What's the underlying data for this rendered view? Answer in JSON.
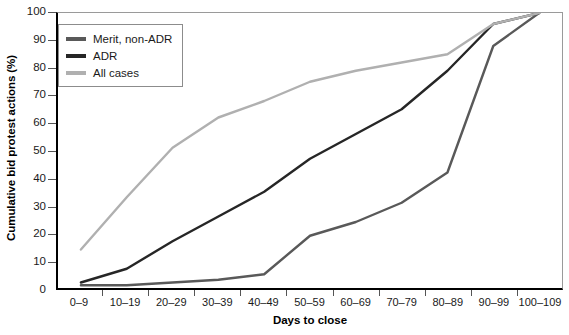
{
  "chart_data": {
    "type": "line",
    "title": "",
    "xlabel": "Days to close",
    "ylabel": "Cumulative bid protest actions (%)",
    "categories": [
      "0–9",
      "10–19",
      "20–29",
      "30–39",
      "40–49",
      "50–59",
      "60–69",
      "70–79",
      "80–89",
      "90–99",
      "100–109"
    ],
    "ylim": [
      0,
      100
    ],
    "yticks": [
      0,
      10,
      20,
      30,
      40,
      50,
      60,
      70,
      80,
      90,
      100
    ],
    "grid": false,
    "legend_position": "top-left",
    "series": [
      {
        "name": "Merit, non-ADR",
        "color": "#595959",
        "values": [
          1,
          1,
          2,
          3,
          5,
          19,
          24,
          31,
          42,
          88,
          100
        ]
      },
      {
        "name": "ADR",
        "color": "#262626",
        "values": [
          2,
          7,
          17,
          26,
          35,
          47,
          56,
          65,
          79,
          96,
          100
        ]
      },
      {
        "name": "All cases",
        "color": "#b0b0b0",
        "values": [
          14,
          33,
          51,
          62,
          68,
          75,
          79,
          82,
          85,
          96,
          100
        ]
      }
    ]
  },
  "legend": {
    "items": [
      {
        "label": "Merit, non-ADR",
        "color": "#595959"
      },
      {
        "label": "ADR",
        "color": "#262626"
      },
      {
        "label": "All cases",
        "color": "#b0b0b0"
      }
    ]
  }
}
